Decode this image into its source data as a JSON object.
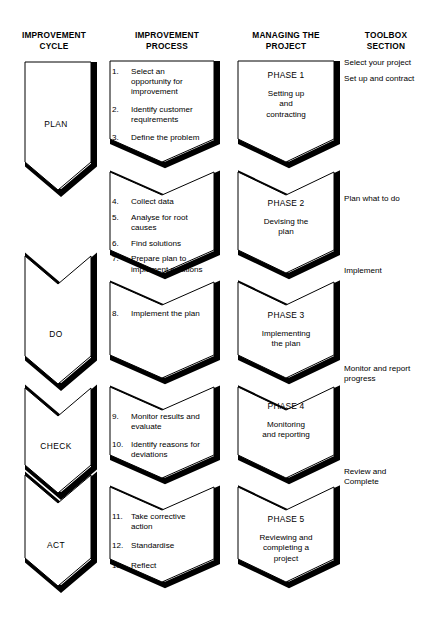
{
  "headers": {
    "cycle": "IMPROVEMENT\nCYCLE",
    "process": "IMPROVEMENT\nPROCESS",
    "project": "MANAGING THE\nPROJECT",
    "toolbox": "TOOLBOX\nSECTION"
  },
  "colors": {
    "outline": "#000000",
    "shadow": "#000000",
    "background": "#ffffff",
    "text": "#000000"
  },
  "cycle_blocks": [
    {
      "label": "PLAN"
    },
    {
      "label": "DO"
    },
    {
      "label": "CHECK"
    },
    {
      "label": "ACT"
    }
  ],
  "process_blocks": [
    {
      "items": [
        {
          "num": "1.",
          "text": "Select an opportunity for improvement"
        },
        {
          "num": "2.",
          "text": "Identify customer requirements"
        },
        {
          "num": "3.",
          "text": "Define the problem"
        }
      ]
    },
    {
      "items": [
        {
          "num": "4.",
          "text": "Collect data"
        },
        {
          "num": "5.",
          "text": "Analyse for root causes"
        },
        {
          "num": "6.",
          "text": "Find solutions"
        },
        {
          "num": "7.",
          "text": "Prepare plan to implement solutions"
        }
      ]
    },
    {
      "items": [
        {
          "num": "8.",
          "text": "Implement the plan"
        }
      ]
    },
    {
      "items": [
        {
          "num": "9.",
          "text": "Monitor results and evaluate"
        },
        {
          "num": "10.",
          "text": "Identify reasons for deviations"
        }
      ]
    },
    {
      "items": [
        {
          "num": "11.",
          "text": "Take corrective action"
        },
        {
          "num": "12.",
          "text": "Standardise"
        },
        {
          "num": "13.",
          "text": "Reflect"
        }
      ]
    }
  ],
  "project_blocks": [
    {
      "title": "PHASE 1",
      "subtitle": "Setting up\nand\ncontracting"
    },
    {
      "title": "PHASE 2",
      "subtitle": "Devising the\nplan"
    },
    {
      "title": "PHASE 3",
      "subtitle": "Implementing\nthe plan"
    },
    {
      "title": "PHASE 4",
      "subtitle": "Monitoring\nand reporting"
    },
    {
      "title": "PHASE 5",
      "subtitle": "Reviewing and\ncompleting a\nproject"
    }
  ],
  "toolbox_items": [
    {
      "text": "Select your project"
    },
    {
      "text": "Set up and contract"
    },
    {
      "text": "Plan what to do"
    },
    {
      "text": "Implement"
    },
    {
      "text": "Monitor and report\nprogress"
    },
    {
      "text": "Review and\nComplete"
    }
  ]
}
